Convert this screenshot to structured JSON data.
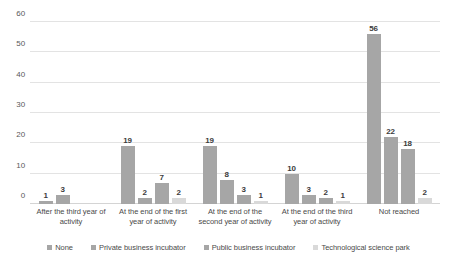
{
  "chart_data": {
    "type": "bar",
    "title": "",
    "xlabel": "",
    "ylabel": "",
    "ylim": [
      0,
      60
    ],
    "yticks": [
      0,
      10,
      20,
      30,
      40,
      50,
      60
    ],
    "grid": true,
    "legend_position": "bottom",
    "categories": [
      "After  the third year of activity",
      "At the end of the first year of activity",
      "At the end of the second year of activity",
      "At the end of the third year of activity",
      "Not reached"
    ],
    "series": [
      {
        "name": "None",
        "color": "#a6a6a6",
        "values": [
          1,
          19,
          19,
          10,
          56
        ]
      },
      {
        "name": "Private business incubator",
        "color": "#a6a6a6",
        "values": [
          3,
          2,
          8,
          3,
          22
        ]
      },
      {
        "name": "Public business incubator",
        "color": "#a6a6a6",
        "values": [
          0,
          7,
          3,
          2,
          18
        ]
      },
      {
        "name": "Technological science park",
        "color": "#d9d9d9",
        "values": [
          0,
          2,
          1,
          1,
          2
        ]
      }
    ]
  }
}
